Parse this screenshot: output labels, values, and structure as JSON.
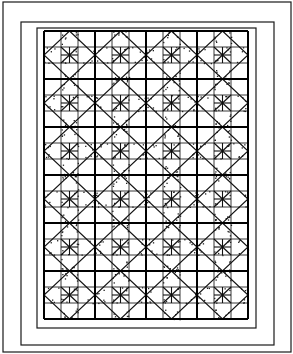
{
  "diagram": {
    "type": "quilt-pattern",
    "canvas": {
      "width": 293,
      "height": 354
    },
    "colors": {
      "line": "#111111",
      "background": "#ffffff",
      "dots": "#222222"
    },
    "frame_rects": [
      {
        "x": 3,
        "y": 2,
        "w": 288,
        "h": 350
      },
      {
        "x": 21,
        "y": 22,
        "w": 253,
        "h": 323
      },
      {
        "x": 37,
        "y": 28,
        "w": 219,
        "h": 300
      }
    ],
    "grid": {
      "x": 44,
      "y": 31,
      "block_cols": 4,
      "block_rows": 6,
      "block_w": 51,
      "block_h": 48,
      "subdivisions": 3
    },
    "block_motif": {
      "lines": [
        "3x3-grid",
        "edge-midpoint-diamond",
        "center-horizontal",
        "center-vertical",
        "center-diagonals"
      ],
      "shaded_triangles": "dotted"
    }
  }
}
